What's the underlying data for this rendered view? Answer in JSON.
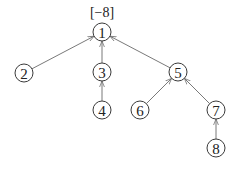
{
  "diagram": {
    "type": "tree",
    "edge_direction": "child-to-parent",
    "root_annotation": "[−8]",
    "nodes": [
      {
        "id": "1",
        "label": "1",
        "x": 102,
        "y": 32
      },
      {
        "id": "2",
        "label": "2",
        "x": 24,
        "y": 73
      },
      {
        "id": "3",
        "label": "3",
        "x": 102,
        "y": 72
      },
      {
        "id": "4",
        "label": "4",
        "x": 102,
        "y": 110
      },
      {
        "id": "5",
        "label": "5",
        "x": 178,
        "y": 72
      },
      {
        "id": "6",
        "label": "6",
        "x": 140,
        "y": 110
      },
      {
        "id": "7",
        "label": "7",
        "x": 216,
        "y": 110
      },
      {
        "id": "8",
        "label": "8",
        "x": 216,
        "y": 148
      }
    ],
    "edges": [
      {
        "from": "2",
        "to": "1"
      },
      {
        "from": "3",
        "to": "1"
      },
      {
        "from": "5",
        "to": "1"
      },
      {
        "from": "4",
        "to": "3"
      },
      {
        "from": "6",
        "to": "5"
      },
      {
        "from": "7",
        "to": "5"
      },
      {
        "from": "8",
        "to": "7"
      }
    ],
    "colors": {
      "edge": "#6a6a6a",
      "node_stroke": "#3a3a3a",
      "text": "#222222"
    }
  }
}
